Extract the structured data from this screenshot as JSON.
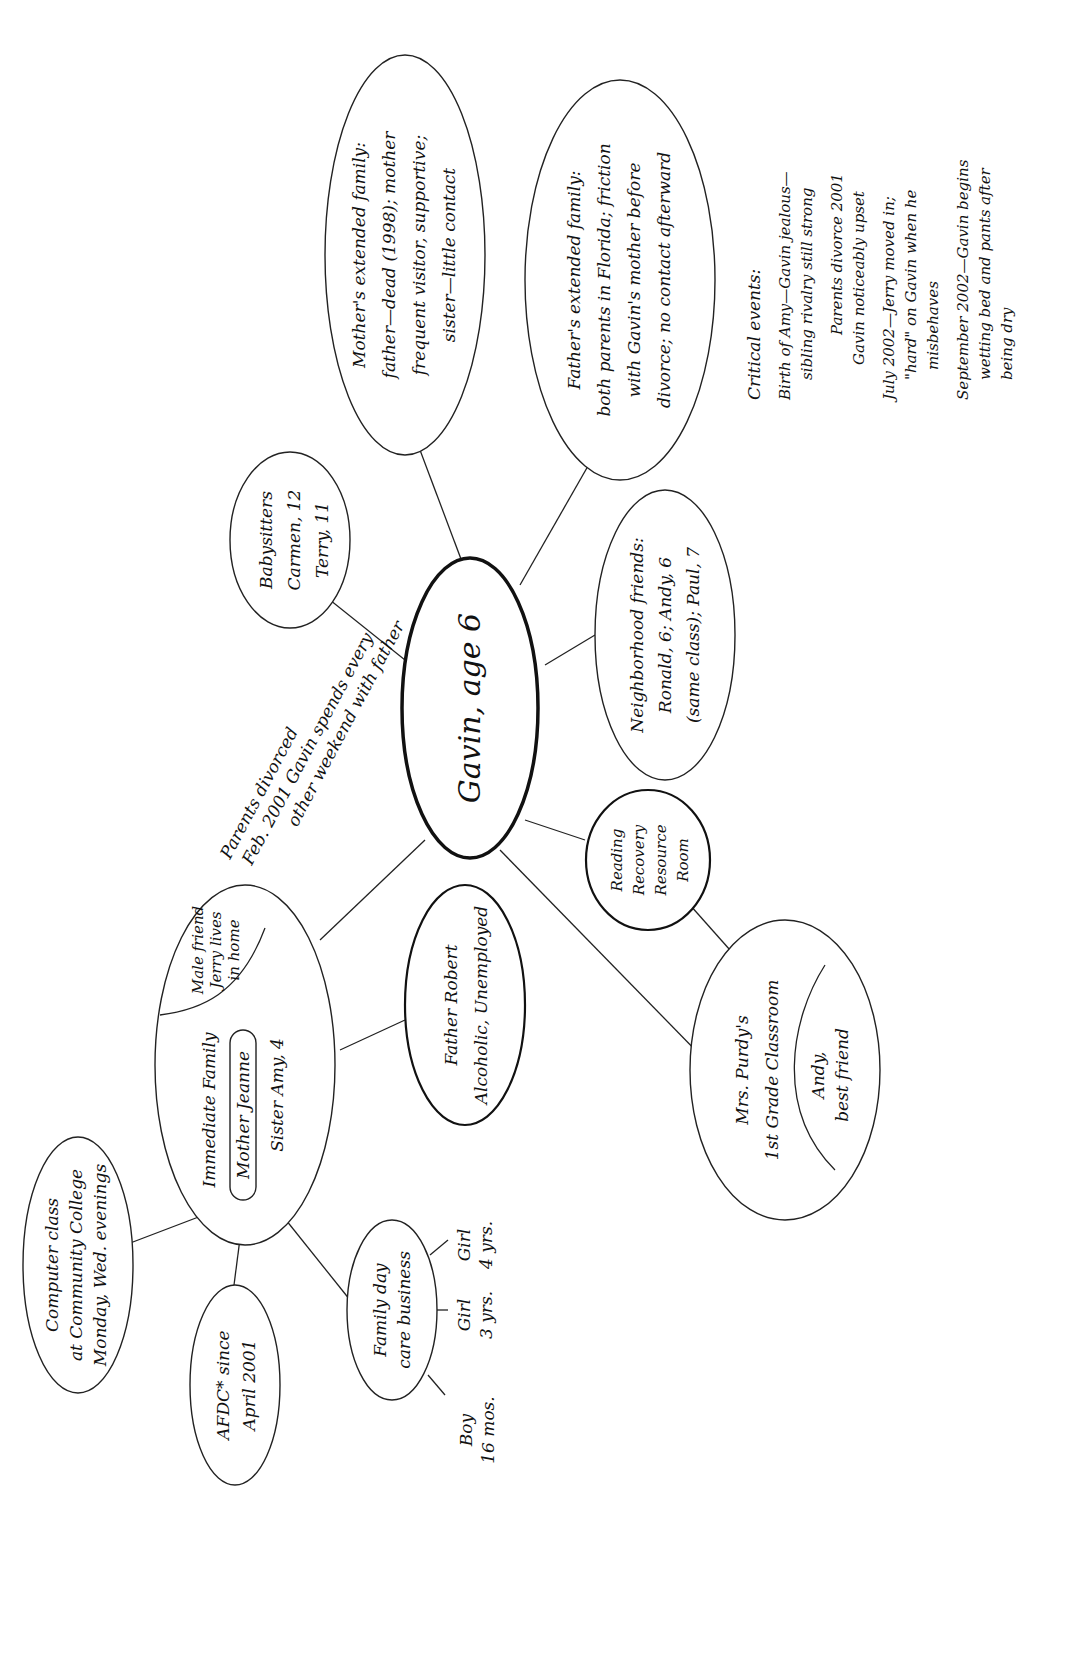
{
  "diagram": {
    "orientation": "rotated 90deg counter-clockwise",
    "center": {
      "label": "Gavin, age 6"
    },
    "nodes": {
      "mothers_family": {
        "lines": [
          "Mother's extended family:",
          "father—dead (1998); mother",
          "frequent visitor, supportive;",
          "sister—little contact"
        ]
      },
      "fathers_family": {
        "lines": [
          "Father's extended family:",
          "both parents in Florida; friction",
          "with Gavin's mother before",
          "divorce; no contact afterward"
        ]
      },
      "babysitters": {
        "lines": [
          "Babysitters",
          "Carmen, 12",
          "Terry, 11"
        ]
      },
      "neighborhood": {
        "lines": [
          "Neighborhood friends:",
          "Ronald, 6; Andy, 6",
          "(same class); Paul, 7"
        ]
      },
      "reading": {
        "lines": [
          "Reading",
          "Recovery",
          "Resource",
          "Room"
        ]
      },
      "classroom": {
        "lines": [
          "Mrs. Purdy's",
          "1st Grade Classroom"
        ],
        "inner": [
          "Andy,",
          "best friend"
        ]
      },
      "father": {
        "lines": [
          "Father Robert",
          "Alcoholic, Unemployed"
        ]
      },
      "immediate_family": {
        "title": "Immediate Family",
        "mother": "Mother Jeanne",
        "sister": "Sister Amy, 4",
        "male_friend": [
          "Male friend",
          "Jerry lives",
          "in home"
        ]
      },
      "computer_class": {
        "lines": [
          "Computer class",
          "at Community College",
          "Monday, Wed. evenings"
        ]
      },
      "afdc": {
        "lines": [
          "AFDC* since",
          "April 2001"
        ]
      },
      "daycare": {
        "lines": [
          "Family day",
          "care business"
        ],
        "children": [
          {
            "lines": [
              "Boy",
              "16 mos."
            ]
          },
          {
            "lines": [
              "Girl",
              "3 yrs."
            ]
          },
          {
            "lines": [
              "Girl",
              "4 yrs."
            ]
          }
        ]
      }
    },
    "divorce_note": {
      "lines": [
        "Parents divorced",
        "Feb. 2001",
        "Gavin spends every",
        "other weekend with father"
      ],
      "line_a": "Parents divorced",
      "line_b": "Feb. 2001 Gavin spends every",
      "line_c": "other weekend with father"
    },
    "critical_events": {
      "title": "Critical events:",
      "items": [
        {
          "lines": [
            "Birth of Amy—Gavin jealous—",
            "sibling rivalry still strong"
          ]
        },
        {
          "lines": [
            "Parents divorce 2001",
            "Gavin noticeably upset"
          ]
        },
        {
          "lines": [
            "July 2002—Jerry moved in;",
            "\"hard\" on Gavin when he",
            "misbehaves"
          ]
        },
        {
          "lines": [
            "September 2002—Gavin begins",
            "wetting bed and pants after",
            "being dry"
          ]
        }
      ]
    }
  }
}
